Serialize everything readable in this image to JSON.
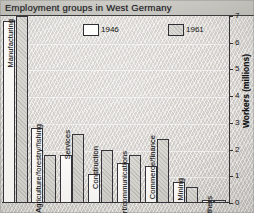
{
  "title": "Employment groups in West Germany",
  "axis": {
    "y_title": "Workers (millions)",
    "ticks": [
      "0",
      "1",
      "2",
      "3",
      "4",
      "5",
      "6",
      "7"
    ]
  },
  "legend": [
    {
      "label": "1946",
      "key": "1946"
    },
    {
      "label": "1961",
      "key": "1961"
    }
  ],
  "chart_data": {
    "type": "bar",
    "title": "Employment groups in West Germany",
    "xlabel": "",
    "ylabel": "Workers (millions)",
    "ylim": [
      0,
      7
    ],
    "grid": true,
    "legend_position": "top-center",
    "categories": [
      "Manufacturing",
      "Agriculture/forestry/fishing",
      "Services",
      "Construction",
      "Transport/communications",
      "Commerce/finance",
      "Mining",
      "Others"
    ],
    "series": [
      {
        "name": "1946",
        "values": [
          6.8,
          2.8,
          1.8,
          1.1,
          1.5,
          1.4,
          0.8,
          0.1
        ]
      },
      {
        "name": "1961",
        "values": [
          7.0,
          1.8,
          2.6,
          2.0,
          1.8,
          2.4,
          0.6,
          0.1
        ]
      }
    ]
  }
}
